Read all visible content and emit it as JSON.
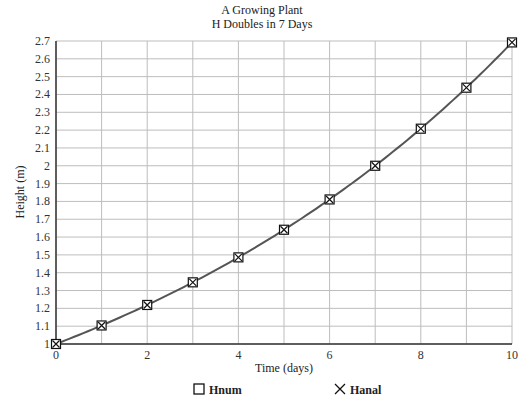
{
  "chart_data": {
    "type": "line",
    "title": "A Growing Plant",
    "subtitle": "H Doubles in 7 Days",
    "xlabel": "Time (days)",
    "ylabel": "Height (m)",
    "xlim": [
      0,
      10
    ],
    "ylim": [
      1,
      2.7
    ],
    "x_ticks": [
      "0",
      "2",
      "4",
      "6",
      "8",
      "10"
    ],
    "y_ticks": [
      "1",
      "1.1",
      "1.2",
      "1.3",
      "1.4",
      "1.5",
      "1.6",
      "1.7",
      "1.8",
      "1.9",
      "2",
      "2.1",
      "2.2",
      "2.3",
      "2.4",
      "2.5",
      "2.6",
      "2.7"
    ],
    "grid": true,
    "x_grid_step": 1,
    "y_grid_step": 0.1,
    "legend_position": "bottom",
    "x": [
      0,
      1,
      2,
      3,
      4,
      5,
      6,
      7,
      8,
      9,
      10
    ],
    "series": [
      {
        "name": "Hnum",
        "marker": "square",
        "values": [
          1.0,
          1.104,
          1.219,
          1.346,
          1.486,
          1.641,
          1.811,
          2.0,
          2.208,
          2.438,
          2.692
        ]
      },
      {
        "name": "Hanal",
        "marker": "x",
        "line": true,
        "values": [
          1.0,
          1.104,
          1.219,
          1.346,
          1.486,
          1.641,
          1.811,
          2.0,
          2.208,
          2.438,
          2.692
        ]
      }
    ],
    "colors": {
      "line": "#555555",
      "grid": "#bdbdbd",
      "axis": "#333333",
      "marker": "#111111"
    }
  },
  "legend": {
    "items": [
      {
        "symbol": "□",
        "label": "Hnum"
      },
      {
        "symbol": "×",
        "label": "Hanal"
      }
    ]
  }
}
